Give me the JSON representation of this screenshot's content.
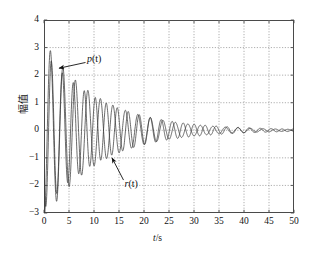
{
  "chart_data": {
    "type": "line",
    "title": "",
    "xlabel": "t/s",
    "ylabel": "幅值",
    "xlim": [
      0,
      50
    ],
    "ylim": [
      -3,
      4
    ],
    "xticks": [
      0,
      5,
      10,
      15,
      20,
      25,
      30,
      35,
      40,
      45,
      50
    ],
    "yticks": [
      4,
      3,
      2,
      1,
      0,
      -1,
      -2,
      -3
    ],
    "grid": true,
    "grid_style": "dotted",
    "legend": "inline-annotations",
    "annotations": [
      {
        "text": "p(t)",
        "label_x": 8.8,
        "label_y": 2.55,
        "arrow_to_x": 3.0,
        "arrow_to_y": 2.25
      },
      {
        "text": "r(t)",
        "label_x": 16.5,
        "label_y": -1.95,
        "arrow_to_x": 13.6,
        "arrow_to_y": -1.0
      }
    ],
    "series": [
      {
        "name": "p(t)",
        "color": "#3a3a3a",
        "model": "damped_oscillation",
        "amplitude": 3.25,
        "damping": 0.092,
        "frequency_hz": 0.4,
        "phase_deg": -95,
        "offset": 0,
        "notes": "Lightly damped sinusoid, first positive peak ~3.2 near t=2.5, decays to ~0 by t=35"
      },
      {
        "name": "r(t)",
        "color": "#3a3a3a",
        "model": "damped_oscillation",
        "amplitude": 2.85,
        "damping": 0.085,
        "frequency_hz": 0.455,
        "phase_deg": -150,
        "offset": 0,
        "notes": "Slightly higher frequency than p(t), produces beating/interference, minimum ~-2.7 near t=3.5"
      }
    ]
  },
  "axes": {
    "y_tick_labels": [
      "4",
      "3",
      "2",
      "1",
      "0",
      "−1",
      "−2",
      "−3"
    ],
    "x_tick_labels": [
      "0",
      "5",
      "10",
      "15",
      "20",
      "25",
      "30",
      "35",
      "40",
      "45",
      "50"
    ],
    "x_axis_label_var": "t",
    "x_axis_label_unit": "/s",
    "y_axis_label": "幅值"
  },
  "labels": {
    "p_var": "p",
    "p_arg": "(t)",
    "r_var": "r",
    "r_arg": "(t)"
  },
  "colors": {
    "curve": "#3a3a3a",
    "grid": "#9a9a9a",
    "frame": "#4a4a4a",
    "text": "#111111",
    "background": "#ffffff"
  }
}
